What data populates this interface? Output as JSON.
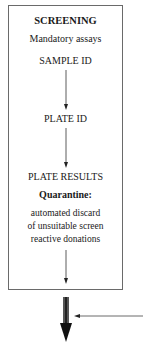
{
  "diagram": {
    "box": {
      "title": "SCREENING",
      "subtitle": "Mandatory assays",
      "steps": [
        "SAMPLE ID",
        "PLATE ID",
        "PLATE RESULTS"
      ],
      "quarantine": {
        "heading": "Quarantine:",
        "lines": [
          "automated discard",
          "of unsuitable screen",
          "reactive donations"
        ]
      }
    },
    "arrows": {
      "internal": [
        "SAMPLE ID -> PLATE ID",
        "PLATE ID -> PLATE RESULTS",
        "Quarantine -> box exit"
      ],
      "output": "thick downward arrow",
      "input": "horizontal arrow from right"
    },
    "colors": {
      "border": "#6a6a6a",
      "text": "#1a1a1a",
      "arrow": "#333333"
    }
  }
}
